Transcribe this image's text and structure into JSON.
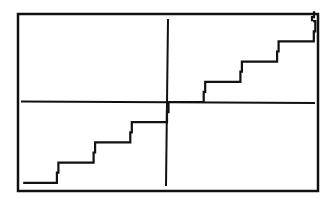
{
  "chart_data": {
    "type": "line",
    "title": "",
    "subtitle": "Graphing calculator plot of the greatest integer (step) function y = int(x)",
    "xlabel": "",
    "ylabel": "",
    "function": "y = floor(x)",
    "xlim": [
      -4.1,
      4.1
    ],
    "ylim": [
      -4.1,
      4.1
    ],
    "grid": false,
    "legend": null,
    "axes_visible": true,
    "tick_labels": [],
    "series": [
      {
        "name": "int(x)",
        "segments": [
          {
            "x": [
              -4,
              -3
            ],
            "y": -4
          },
          {
            "x": [
              -3,
              -2
            ],
            "y": -3
          },
          {
            "x": [
              -2,
              -1
            ],
            "y": -2
          },
          {
            "x": [
              -1,
              0
            ],
            "y": -1
          },
          {
            "x": [
              0,
              1
            ],
            "y": 0
          },
          {
            "x": [
              1,
              2
            ],
            "y": 1
          },
          {
            "x": [
              2,
              3
            ],
            "y": 2
          },
          {
            "x": [
              3,
              4
            ],
            "y": 3
          },
          {
            "x": [
              4,
              4.1
            ],
            "y": 4
          }
        ]
      }
    ]
  },
  "colors": {
    "background": "#ffffff",
    "ink": "#111111"
  }
}
